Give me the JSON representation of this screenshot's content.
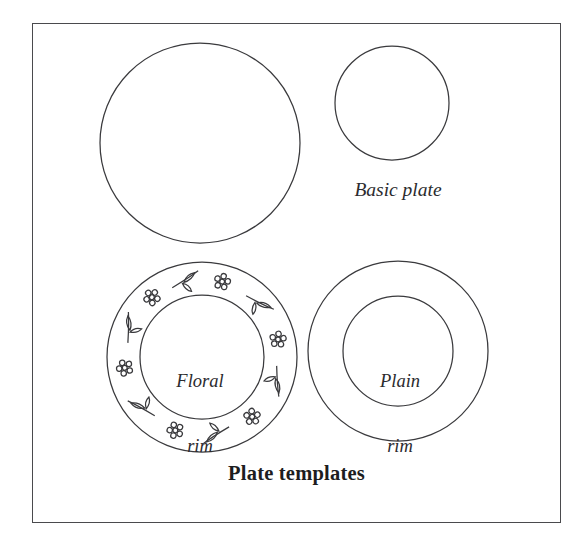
{
  "figure": {
    "caption": "Plate templates",
    "frame": {
      "x": 32,
      "y": 23,
      "width": 529,
      "height": 500,
      "stroke_color": "#4a4a4d",
      "background_color": "#ffffff"
    },
    "stroke_color": "#3a3a3d",
    "shapes": [
      {
        "name": "large-plain-circle",
        "type": "circle",
        "cx": 200,
        "cy": 143,
        "r": 100,
        "label": ""
      },
      {
        "name": "small-plain-circle",
        "type": "circle",
        "cx": 392,
        "cy": 103,
        "r": 57,
        "label": "Basic plate"
      },
      {
        "name": "floral-rim-plate",
        "type": "ring",
        "cx": 202,
        "cy": 357,
        "outer_r": 95,
        "inner_r": 62,
        "label_line1": "Floral",
        "label_line2": "rim",
        "decoration": "floral-rim-motifs"
      },
      {
        "name": "plain-rim-plate",
        "type": "ring",
        "cx": 398,
        "cy": 351,
        "outer_r": 90,
        "inner_r": 55,
        "label_line1": "Plain",
        "label_line2": "rim",
        "decoration": "none"
      }
    ],
    "labels": {
      "basic_plate": "Basic plate",
      "floral_rim_line1": "Floral",
      "floral_rim_line2": "rim",
      "plain_rim_line1": "Plain",
      "plain_rim_line2": "rim"
    },
    "floral_decoration": {
      "motif_count": 12,
      "motif_types": [
        "flower-cluster",
        "leaf-sprig"
      ],
      "flower_petal_count": 6,
      "leaves_per_sprig": 2
    }
  }
}
